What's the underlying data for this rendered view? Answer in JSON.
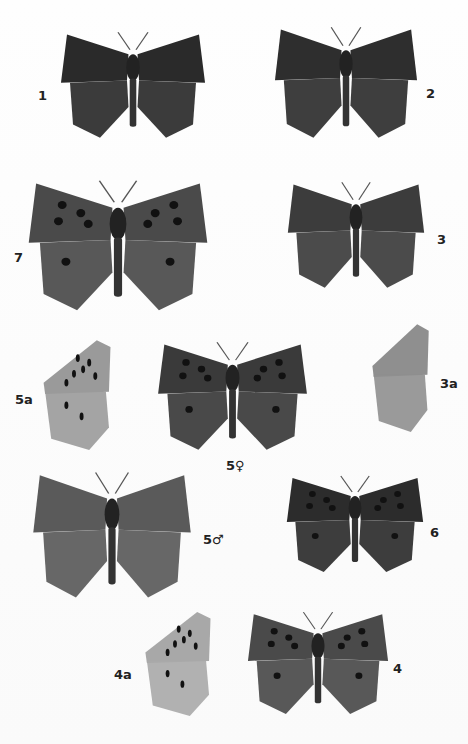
{
  "plate": {
    "background": "#fdfdfd",
    "figures": [
      {
        "id": "1",
        "label": "1",
        "view": "upperside",
        "tone": "#2a2a2a",
        "x": 58,
        "y": 30,
        "w": 150,
        "h": 110,
        "label_x": 38,
        "label_y": 88
      },
      {
        "id": "2",
        "label": "2",
        "view": "upperside",
        "tone": "#2e2e2e",
        "x": 272,
        "y": 25,
        "w": 148,
        "h": 115,
        "label_x": 426,
        "label_y": 86
      },
      {
        "id": "7",
        "label": "7",
        "view": "upperside",
        "tone": "#4a4a4a",
        "x": 25,
        "y": 178,
        "w": 186,
        "h": 135,
        "label_x": 14,
        "label_y": 250
      },
      {
        "id": "3",
        "label": "3",
        "view": "upperside",
        "tone": "#3c3c3c",
        "x": 285,
        "y": 180,
        "w": 142,
        "h": 110,
        "label_x": 437,
        "label_y": 232
      },
      {
        "id": "5a",
        "label": "5a",
        "view": "underside",
        "tone": "#9a9a9a",
        "x": 36,
        "y": 338,
        "w": 76,
        "h": 112,
        "label_x": 15,
        "label_y": 392
      },
      {
        "id": "5f",
        "label": "5♀",
        "view": "upperside",
        "tone": "#3a3a3a",
        "x": 155,
        "y": 340,
        "w": 155,
        "h": 112,
        "label_x": 226,
        "label_y": 458
      },
      {
        "id": "3a",
        "label": "3a",
        "view": "underside",
        "tone": "#8f8f8f",
        "x": 366,
        "y": 322,
        "w": 64,
        "h": 110,
        "label_x": 440,
        "label_y": 376
      },
      {
        "id": "5m",
        "label": "5♂",
        "view": "upperside",
        "tone": "#5a5a5a",
        "x": 30,
        "y": 470,
        "w": 164,
        "h": 130,
        "label_x": 203,
        "label_y": 532
      },
      {
        "id": "6",
        "label": "6",
        "view": "upperside",
        "tone": "#2c2c2c",
        "x": 284,
        "y": 474,
        "w": 142,
        "h": 100,
        "label_x": 430,
        "label_y": 525
      },
      {
        "id": "4a",
        "label": "4a",
        "view": "underside",
        "tone": "#a8a8a8",
        "x": 138,
        "y": 610,
        "w": 74,
        "h": 106,
        "label_x": 114,
        "label_y": 667
      },
      {
        "id": "4",
        "label": "4",
        "view": "upperside",
        "tone": "#4a4a4a",
        "x": 245,
        "y": 610,
        "w": 146,
        "h": 106,
        "label_x": 393,
        "label_y": 661
      }
    ]
  }
}
